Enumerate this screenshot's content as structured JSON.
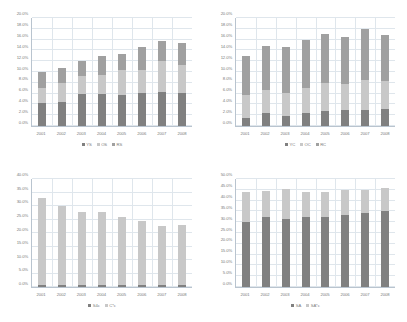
{
  "palette": {
    "dark": "#808080",
    "light": "#c8c8c8",
    "medium": "#a0a0a0",
    "background": "#ffffff",
    "gridline": "#dfe6ec",
    "axis": "#b9c4cf",
    "text": "#7a7a7a"
  },
  "chart_data": [
    {
      "id": "top-left",
      "type": "bar",
      "stacked": true,
      "title": "",
      "xlabel": "",
      "ylabel": "",
      "ylim": [
        0,
        20
      ],
      "ytick_step": 2,
      "ytick_labels": [
        "0.0%",
        "2.0%",
        "4.0%",
        "6.0%",
        "8.0%",
        "10.0%",
        "12.0%",
        "14.0%",
        "16.0%",
        "18.0%",
        "20.0%"
      ],
      "grid": true,
      "legend_position": "bottom",
      "categories": [
        "2001",
        "2002",
        "2003",
        "2004",
        "2005",
        "2006",
        "2007",
        "2008"
      ],
      "series": [
        {
          "name": "YS",
          "color": "#808080",
          "values": [
            4.3,
            4.4,
            5.9,
            5.9,
            5.8,
            6.1,
            6.3,
            6.2
          ]
        },
        {
          "name": "OS",
          "color": "#c8c8c8",
          "values": [
            2.8,
            3.6,
            3.4,
            3.6,
            4.5,
            4.2,
            5.7,
            5.1
          ]
        },
        {
          "name": "RS",
          "color": "#a0a0a0",
          "values": [
            2.9,
            2.8,
            2.7,
            3.5,
            3.0,
            4.4,
            3.7,
            4.1
          ]
        }
      ]
    },
    {
      "id": "top-right",
      "type": "bar",
      "stacked": true,
      "title": "",
      "xlabel": "",
      "ylabel": "",
      "ylim": [
        0,
        20
      ],
      "ytick_step": 2,
      "ytick_labels": [
        "0.0%",
        "2.0%",
        "4.0%",
        "6.0%",
        "8.0%",
        "10.0%",
        "12.0%",
        "14.0%",
        "16.0%",
        "18.0%",
        "20.0%"
      ],
      "grid": true,
      "legend_position": "bottom",
      "categories": [
        "2001",
        "2002",
        "2003",
        "2004",
        "2005",
        "2006",
        "2007",
        "2008"
      ],
      "series": [
        {
          "name": "YC",
          "color": "#808080",
          "values": [
            1.5,
            2.4,
            1.9,
            2.4,
            2.7,
            3.0,
            3.0,
            3.2
          ]
        },
        {
          "name": "OC",
          "color": "#c8c8c8",
          "values": [
            4.3,
            4.2,
            4.2,
            4.7,
            5.3,
            4.8,
            5.5,
            5.1
          ]
        },
        {
          "name": "RC",
          "color": "#a0a0a0",
          "values": [
            7.2,
            8.3,
            8.5,
            8.9,
            9.0,
            8.6,
            9.5,
            8.6
          ]
        }
      ]
    },
    {
      "id": "bottom-left",
      "type": "bar",
      "stacked": true,
      "title": "",
      "xlabel": "",
      "ylabel": "",
      "ylim": [
        0,
        40
      ],
      "ytick_step": 5,
      "ytick_labels": [
        "0.0%",
        "5.0%",
        "10.0%",
        "15.0%",
        "20.0%",
        "25.0%",
        "30.0%",
        "35.0%",
        "40.0%"
      ],
      "grid": true,
      "legend_position": "bottom",
      "categories": [
        "2001",
        "2002",
        "2003",
        "2004",
        "2005",
        "2006",
        "2007",
        "2008"
      ],
      "series": [
        {
          "name": "S4c",
          "color": "#808080",
          "values": [
            0.8,
            0.7,
            0.7,
            0.7,
            0.7,
            0.7,
            0.6,
            0.6
          ]
        },
        {
          "name": "C*c",
          "color": "#c8c8c8",
          "values": [
            32.2,
            29.3,
            27.1,
            27.1,
            25.3,
            23.7,
            21.9,
            22.4
          ]
        }
      ]
    },
    {
      "id": "bottom-right",
      "type": "bar",
      "stacked": true,
      "title": "",
      "xlabel": "",
      "ylabel": "",
      "ylim": [
        0,
        50
      ],
      "ytick_step": 5,
      "ytick_labels": [
        "0.0%",
        "5.0%",
        "10.0%",
        "15.0%",
        "20.0%",
        "25.0%",
        "30.0%",
        "35.0%",
        "40.0%",
        "45.0%",
        "50.0%"
      ],
      "grid": true,
      "legend_position": "bottom",
      "categories": [
        "2001",
        "2002",
        "2003",
        "2004",
        "2005",
        "2006",
        "2007",
        "2008"
      ],
      "series": [
        {
          "name": "SA",
          "color": "#808080",
          "values": [
            30.0,
            32.5,
            31.5,
            32.3,
            32.4,
            33.3,
            34.4,
            35.2
          ]
        },
        {
          "name": "SA*c",
          "color": "#c8c8c8",
          "values": [
            14.0,
            12.0,
            13.8,
            11.8,
            11.7,
            11.7,
            10.6,
            10.6
          ]
        }
      ]
    }
  ]
}
